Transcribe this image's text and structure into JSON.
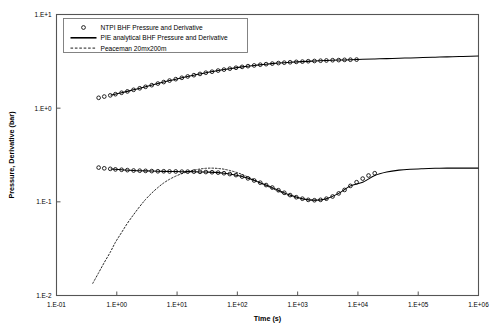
{
  "chart_data": {
    "type": "line",
    "title": "",
    "xlabel": "Time (s)",
    "ylabel": "Pressure, Derivative (bar)",
    "xscale": "log",
    "yscale": "log",
    "xlim": [
      0.1,
      1000000
    ],
    "ylim": [
      0.01,
      10
    ],
    "grid": false,
    "legend_position": "top-left",
    "xticks": [
      "1.E-01",
      "1.E+00",
      "1.E+01",
      "1.E+02",
      "1.E+03",
      "1.E+04",
      "1.E+05",
      "1.E+06"
    ],
    "yticks": [
      "1.E+1",
      "1.E+0",
      "1.E-1",
      "1.E-2"
    ],
    "xtick_values": [
      0.1,
      1,
      10,
      100,
      1000,
      10000,
      100000,
      1000000
    ],
    "ytick_values": [
      10,
      1,
      0.1,
      0.01
    ],
    "series": [
      {
        "name": "NTPI BHF Pressure and Derivative",
        "style": "markers",
        "marker": "open-circle",
        "color": "#000000",
        "quantity": "pressure",
        "x": [
          0.5,
          0.62,
          0.78,
          0.95,
          1.2,
          1.5,
          1.9,
          2.4,
          3.0,
          3.8,
          4.8,
          6.0,
          7.5,
          9.5,
          12,
          15,
          19,
          24,
          30,
          38,
          48,
          60,
          75,
          95,
          120,
          150,
          190,
          240,
          300,
          380,
          480,
          600,
          750,
          950,
          1200,
          1500,
          1900,
          2400,
          3000,
          3800,
          4800,
          6000,
          7500,
          9500
        ],
        "y": [
          1.29,
          1.33,
          1.37,
          1.41,
          1.46,
          1.51,
          1.57,
          1.63,
          1.69,
          1.76,
          1.83,
          1.9,
          1.97,
          2.04,
          2.11,
          2.18,
          2.25,
          2.32,
          2.39,
          2.45,
          2.52,
          2.58,
          2.64,
          2.7,
          2.76,
          2.81,
          2.86,
          2.91,
          2.95,
          2.99,
          3.03,
          3.06,
          3.09,
          3.12,
          3.14,
          3.17,
          3.19,
          3.21,
          3.23,
          3.25,
          3.26,
          3.28,
          3.29,
          3.3
        ]
      },
      {
        "name": "NTPI BHF Pressure and Derivative",
        "style": "markers",
        "marker": "open-circle",
        "color": "#000000",
        "quantity": "derivative",
        "x": [
          0.5,
          0.62,
          0.78,
          0.95,
          1.2,
          1.5,
          1.9,
          2.4,
          3.0,
          3.8,
          4.8,
          6.0,
          7.5,
          9.5,
          12,
          15,
          19,
          24,
          30,
          38,
          48,
          60,
          75,
          95,
          120,
          150,
          190,
          240,
          300,
          380,
          480,
          600,
          750,
          950,
          1200,
          1500,
          1900,
          2400,
          3000,
          3800,
          4800,
          6000,
          7500,
          9500,
          12000,
          15000,
          19000
        ],
        "y": [
          0.232,
          0.228,
          0.225,
          0.222,
          0.22,
          0.218,
          0.216,
          0.215,
          0.214,
          0.213,
          0.212,
          0.212,
          0.211,
          0.211,
          0.21,
          0.21,
          0.21,
          0.209,
          0.208,
          0.207,
          0.205,
          0.202,
          0.198,
          0.193,
          0.186,
          0.178,
          0.169,
          0.16,
          0.151,
          0.142,
          0.133,
          0.125,
          0.118,
          0.112,
          0.108,
          0.105,
          0.104,
          0.105,
          0.108,
          0.114,
          0.123,
          0.134,
          0.148,
          0.162,
          0.177,
          0.191,
          0.202
        ]
      },
      {
        "name": "PIE analytical BHF Pressure and Derivative",
        "style": "solid",
        "color": "#000000",
        "quantity": "pressure",
        "x": [
          0.8,
          1.2,
          1.9,
          3.0,
          4.8,
          7.5,
          12,
          19,
          30,
          48,
          75,
          120,
          190,
          300,
          480,
          750,
          1200,
          1900,
          3000,
          4800,
          7500,
          12000,
          19000,
          30000,
          48000,
          75000,
          120000,
          190000,
          300000,
          480000,
          750000,
          1000000
        ],
        "y": [
          1.38,
          1.46,
          1.57,
          1.69,
          1.83,
          1.97,
          2.11,
          2.25,
          2.39,
          2.52,
          2.64,
          2.76,
          2.86,
          2.95,
          3.03,
          3.09,
          3.14,
          3.19,
          3.23,
          3.26,
          3.29,
          3.32,
          3.35,
          3.38,
          3.41,
          3.44,
          3.47,
          3.5,
          3.53,
          3.56,
          3.58,
          3.6
        ]
      },
      {
        "name": "PIE analytical BHF Pressure and Derivative",
        "style": "solid",
        "color": "#000000",
        "quantity": "derivative",
        "x": [
          0.8,
          1.2,
          1.9,
          3.0,
          4.8,
          7.5,
          12,
          19,
          30,
          48,
          75,
          120,
          190,
          300,
          480,
          750,
          1200,
          1900,
          3000,
          4800,
          7500,
          12000,
          19000,
          30000,
          48000,
          75000,
          120000,
          190000,
          300000,
          480000,
          750000,
          1000000
        ],
        "y": [
          0.224,
          0.22,
          0.216,
          0.214,
          0.212,
          0.211,
          0.21,
          0.21,
          0.208,
          0.205,
          0.198,
          0.186,
          0.169,
          0.151,
          0.133,
          0.118,
          0.108,
          0.104,
          0.108,
          0.123,
          0.148,
          0.162,
          0.191,
          0.208,
          0.218,
          0.223,
          0.226,
          0.228,
          0.229,
          0.229,
          0.229,
          0.229
        ]
      },
      {
        "name": "Peaceman 20mx200m",
        "style": "dashed",
        "color": "#000000",
        "quantity": "derivative",
        "x": [
          0.4,
          0.5,
          0.62,
          0.78,
          0.95,
          1.2,
          1.5,
          1.9,
          2.4,
          3.0,
          3.8,
          4.8,
          6.0,
          7.5,
          9.5,
          12,
          15,
          19,
          24,
          30,
          38,
          48,
          60,
          75,
          95,
          120,
          150,
          190,
          240,
          300,
          380,
          480,
          600,
          750,
          950,
          1200,
          1500,
          1900,
          2400,
          3000
        ],
        "y": [
          0.0135,
          0.0175,
          0.0225,
          0.029,
          0.037,
          0.047,
          0.059,
          0.073,
          0.089,
          0.106,
          0.124,
          0.142,
          0.159,
          0.174,
          0.188,
          0.2,
          0.21,
          0.218,
          0.224,
          0.228,
          0.229,
          0.227,
          0.223,
          0.216,
          0.207,
          0.196,
          0.184,
          0.172,
          0.16,
          0.149,
          0.139,
          0.13,
          0.122,
          0.116,
          0.111,
          0.1075,
          0.1055,
          0.1045,
          0.105,
          0.107
        ]
      }
    ],
    "legend": [
      {
        "label": "NTPI BHF Pressure and Derivative",
        "marker": "open-circle"
      },
      {
        "label": "PIE analytical BHF Pressure and Derivative",
        "marker": "solid-line"
      },
      {
        "label": "Peaceman 20mx200m",
        "marker": "dashed-line"
      }
    ]
  }
}
